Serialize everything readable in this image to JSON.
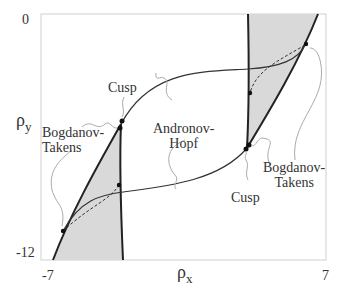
{
  "axes": {
    "x_label": "ρ",
    "x_sub": "x",
    "y_label": "ρ",
    "y_sub": "y",
    "x_min_tick": "-7",
    "x_max_tick": "7",
    "y_max_tick": "0",
    "y_min_tick": "-12"
  },
  "annotations": {
    "cusp_upper": "Cusp",
    "cusp_lower": "Cusp",
    "bt_left_line1": "Bogdanov-",
    "bt_left_line2": "Takens",
    "bt_right_line1": "Bogdanov-",
    "bt_right_line2": "Takens",
    "hopf_line1": "Andronov-",
    "hopf_line2": "Hopf"
  },
  "colors": {
    "fold_region_fill": "#d9d9d9",
    "curve": "#333333",
    "frame": "#cfcfcf",
    "leader": "#aaaaaa"
  }
}
